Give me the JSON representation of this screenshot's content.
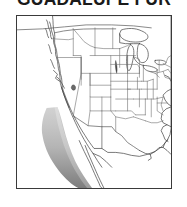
{
  "page": {
    "background_color": "#ffffff",
    "width": 187,
    "height": 207
  },
  "title": {
    "text": "GUADALUPE FUR",
    "color": "#1a1a1a",
    "clipped": "true"
  },
  "map": {
    "caption": "North America range map",
    "frame_color": "#3a3a3a",
    "land_fill": "#ffffff",
    "outline_color": "#3f3f3f",
    "border_color": "#555555",
    "state_line_color": "#6e6e6e",
    "range_shading": {
      "label": "shaded range along Pacific coast",
      "light_color": "#c2c2c2",
      "mid_color": "#a8a8a8",
      "dark_color": "#828282"
    },
    "regions": [
      "Pacific Northwest coast",
      "California coast",
      "Baja California coast",
      "Great Basin",
      "Great Plains",
      "Great Lakes",
      "Northeast",
      "Gulf Coast"
    ]
  }
}
